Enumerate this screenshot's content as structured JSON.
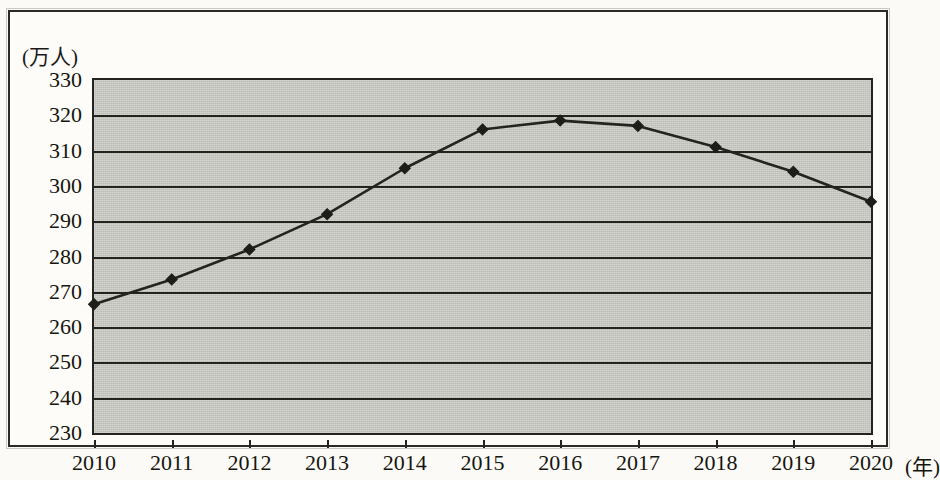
{
  "chart_data": {
    "type": "line",
    "title": "",
    "subtitle": "",
    "xlabel": "(年)",
    "ylabel": "(万人)",
    "categories": [
      "2010",
      "2011",
      "2012",
      "2013",
      "2014",
      "2015",
      "2016",
      "2017",
      "2018",
      "2019",
      "2020"
    ],
    "x": [
      2010,
      2011,
      2012,
      2013,
      2014,
      2015,
      2016,
      2017,
      2018,
      2019,
      2020
    ],
    "values": [
      266.5,
      273.5,
      282,
      292,
      305,
      316,
      318.5,
      317,
      311,
      304,
      295.5
    ],
    "series": [
      {
        "name": "",
        "values": [
          266.5,
          273.5,
          282,
          292,
          305,
          316,
          318.5,
          317,
          311,
          304,
          295.5
        ]
      }
    ],
    "ylim": [
      230,
      330
    ],
    "ytick_step": 10,
    "ytick_labels": [
      "330",
      "320",
      "310",
      "300",
      "290",
      "280",
      "270",
      "260",
      "250",
      "240",
      "230"
    ],
    "ytick_values": [
      330,
      320,
      310,
      300,
      290,
      280,
      270,
      260,
      250,
      240,
      230
    ],
    "xtick_labels": [
      "2010",
      "2011",
      "2012",
      "2013",
      "2014",
      "2015",
      "2016",
      "2017",
      "2018",
      "2019",
      "2020"
    ],
    "grid": true,
    "grid_axis": "y",
    "legend": false,
    "legend_position": "none",
    "marker": "diamond",
    "line_color": "#23231f",
    "marker_color": "#1d1d19",
    "plot_background": "#c9c9c3",
    "annotations": []
  },
  "axes": {
    "y_unit_caption": "(万人)",
    "x_unit_caption": "(年)"
  }
}
